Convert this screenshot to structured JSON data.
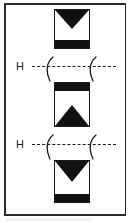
{
  "figure": {
    "domain": "Diagram",
    "frame": {
      "border_color": "#2b2b2b",
      "background": "#ffffff"
    },
    "ink_color": "#111111",
    "states": [
      {
        "name": "state-box-top",
        "order": 1,
        "bar_position": "bottom",
        "triangle_direction": "down",
        "triangle_position": "top",
        "x": 52,
        "y": 6,
        "width": 36,
        "height": 40,
        "bar_height": 8,
        "triangle_height": 18
      },
      {
        "name": "state-box-middle",
        "order": 2,
        "bar_position": "top",
        "triangle_direction": "up",
        "triangle_position": "bottom",
        "x": 52,
        "y": 80,
        "width": 36,
        "height": 45,
        "bar_height": 8,
        "triangle_height": 20
      },
      {
        "name": "state-box-bottom",
        "order": 3,
        "bar_position": "bottom",
        "triangle_direction": "down",
        "triangle_position": "top",
        "x": 52,
        "y": 158,
        "width": 36,
        "height": 43,
        "bar_height": 8,
        "triangle_height": 20
      }
    ],
    "field_lines": [
      {
        "name": "field-line-upper",
        "label": "H",
        "order": 1,
        "y": 54,
        "label_x": 14,
        "line_x": 30,
        "line_width": 82,
        "arc_positions": [
          42,
          85
        ],
        "arc_direction": "left",
        "line_style": "dashed"
      },
      {
        "name": "field-line-lower",
        "label": "H",
        "order": 2,
        "y": 132,
        "label_x": 14,
        "line_x": 30,
        "line_width": 82,
        "arc_positions": [
          42,
          85
        ],
        "arc_direction": "left",
        "line_style": "dashed"
      }
    ]
  }
}
